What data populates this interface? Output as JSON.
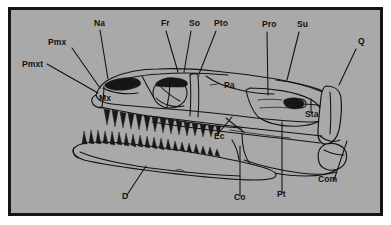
{
  "figure": {
    "type": "anatomical-line-drawing",
    "background_color": "#a9a9a9",
    "border_color": "#151515",
    "ink_color": "#121212",
    "page_background": "#ffffff"
  },
  "labels": [
    {
      "id": "pmxt",
      "text": "Pmxt",
      "x": 22,
      "y": 67
    },
    {
      "id": "pmx",
      "text": "Pmx",
      "x": 48,
      "y": 45
    },
    {
      "id": "na",
      "text": "Na",
      "x": 94,
      "y": 26
    },
    {
      "id": "fr",
      "text": "Fr",
      "x": 161,
      "y": 26
    },
    {
      "id": "so",
      "text": "So",
      "x": 189,
      "y": 26
    },
    {
      "id": "pto",
      "text": "Pto",
      "x": 214,
      "y": 26
    },
    {
      "id": "pro",
      "text": "Pro",
      "x": 262,
      "y": 27
    },
    {
      "id": "su",
      "text": "Su",
      "x": 297,
      "y": 27
    },
    {
      "id": "q",
      "text": "Q",
      "x": 358,
      "y": 44
    },
    {
      "id": "pfr",
      "text": "Pfr",
      "x": 121,
      "y": 87
    },
    {
      "id": "mx",
      "text": "Mx",
      "x": 99,
      "y": 101
    },
    {
      "id": "pa",
      "text": "Pa",
      "x": 224,
      "y": 88
    },
    {
      "id": "sta",
      "text": "Sta",
      "x": 305,
      "y": 117
    },
    {
      "id": "ec",
      "text": "Ec",
      "x": 214,
      "y": 139
    },
    {
      "id": "d",
      "text": "D",
      "x": 122,
      "y": 199
    },
    {
      "id": "co",
      "text": "Co",
      "x": 234,
      "y": 200
    },
    {
      "id": "pt",
      "text": "Pt",
      "x": 277,
      "y": 197
    },
    {
      "id": "com",
      "text": "Com",
      "x": 318,
      "y": 182
    }
  ],
  "leader_lines": [
    {
      "for": "pmxt",
      "points": "47,64 98,93"
    },
    {
      "for": "pmx",
      "points": "72,48 100,88"
    },
    {
      "for": "na",
      "points": "100,30 108,79"
    },
    {
      "for": "fr",
      "points": "166,31 178,72"
    },
    {
      "for": "so",
      "points": "191,31 184,72"
    },
    {
      "for": "pto",
      "points": "216,31 199,74"
    },
    {
      "for": "pro",
      "points": "267,32 268,95"
    },
    {
      "for": "su",
      "points": "299,32 287,80"
    },
    {
      "for": "q",
      "points": "356,49 339,85"
    },
    {
      "for": "sta",
      "points": "311,113 311,99"
    },
    {
      "for": "ec",
      "points": "217,135 232,117"
    },
    {
      "for": "d",
      "points": "127,195 146,166"
    },
    {
      "for": "co",
      "points": "240,196 240,146"
    },
    {
      "for": "pt",
      "points": "282,193 282,122"
    },
    {
      "for": "com",
      "points": "334,180 347,141"
    }
  ],
  "label_glossary": [
    {
      "abbr": "Pmxt",
      "meaning": "premaxillary teeth"
    },
    {
      "abbr": "Pmx",
      "meaning": "premaxilla"
    },
    {
      "abbr": "Na",
      "meaning": "nasal"
    },
    {
      "abbr": "Fr",
      "meaning": "frontal"
    },
    {
      "abbr": "So",
      "meaning": "supraorbital"
    },
    {
      "abbr": "Pto",
      "meaning": "postorbital"
    },
    {
      "abbr": "Pro",
      "meaning": "prootic"
    },
    {
      "abbr": "Su",
      "meaning": "supratemporal"
    },
    {
      "abbr": "Q",
      "meaning": "quadrate"
    },
    {
      "abbr": "Pfr",
      "meaning": "prefrontal"
    },
    {
      "abbr": "Mx",
      "meaning": "maxilla"
    },
    {
      "abbr": "Pa",
      "meaning": "parietal"
    },
    {
      "abbr": "Sta",
      "meaning": "stapes"
    },
    {
      "abbr": "Ec",
      "meaning": "ectopterygoid"
    },
    {
      "abbr": "D",
      "meaning": "dentary"
    },
    {
      "abbr": "Co",
      "meaning": "coronoid"
    },
    {
      "abbr": "Pt",
      "meaning": "pterygoid"
    },
    {
      "abbr": "Com",
      "meaning": "compound bone"
    }
  ]
}
